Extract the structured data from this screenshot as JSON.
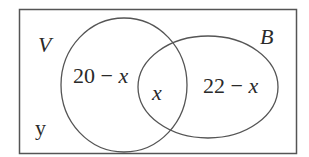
{
  "diagram": {
    "type": "venn",
    "universe_label": "y",
    "sets": [
      {
        "name": "V",
        "label": "V",
        "only_region": "20 − x"
      },
      {
        "name": "B",
        "label": "B",
        "only_region": "22 − x"
      }
    ],
    "intersection": "x",
    "colors": {
      "stroke": "#555555",
      "text": "#2a2a2a",
      "background": "#ffffff"
    }
  },
  "text": {
    "set_v_label": "V",
    "set_b_label": "B",
    "universe_label": "y",
    "v_only_num": "20 − ",
    "v_only_var": "x",
    "intersection_var": "x",
    "b_only_num": "22 − ",
    "b_only_var": "x"
  }
}
